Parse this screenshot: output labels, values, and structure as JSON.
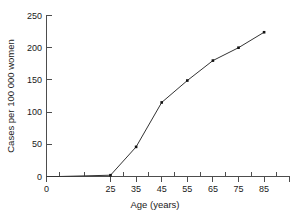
{
  "chart_data": {
    "type": "line",
    "title": "",
    "xlabel": "Age (years)",
    "ylabel": "Cases per 100 000 women",
    "x": [
      0,
      5,
      15,
      25,
      35,
      45,
      55,
      65,
      75,
      85
    ],
    "values": [
      0,
      0,
      1,
      2,
      46,
      115,
      149,
      180,
      200,
      224
    ],
    "xlim": [
      0,
      95
    ],
    "ylim": [
      0,
      250
    ],
    "xticks": [
      0,
      25,
      35,
      45,
      55,
      65,
      75,
      85
    ],
    "xticklabels": [
      "0",
      "25",
      "35",
      "45",
      "55",
      "65",
      "75",
      "85"
    ],
    "xminorticks": [
      5,
      15,
      20,
      30,
      40,
      50,
      60,
      70,
      80,
      90
    ],
    "yticks": [
      0,
      50,
      100,
      150,
      200,
      250
    ],
    "yticklabels": [
      "0",
      "50",
      "100",
      "150",
      "200",
      "250"
    ],
    "grid": false,
    "legend": false,
    "marker": "square",
    "line_color": "#333333",
    "marker_color": "#111111",
    "axis_color": "#4d4d4d"
  },
  "labels": {
    "y_axis_title": "Cases per 100 000 women",
    "x_axis_title": "Age (years)",
    "y_250": "250",
    "y_200": "200",
    "y_150": "150",
    "y_100": "100",
    "y_50": "50",
    "y_0": "0",
    "x_0": "0",
    "x_25": "25",
    "x_35": "35",
    "x_45": "45",
    "x_55": "55",
    "x_65": "65",
    "x_75": "75",
    "x_85": "85"
  }
}
